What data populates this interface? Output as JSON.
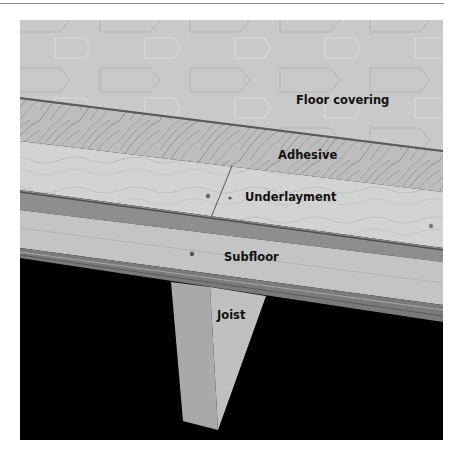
{
  "figure": {
    "labels": {
      "floor_covering": "Floor covering",
      "adhesive": "Adhesive",
      "underlayment": "Underlayment",
      "subfloor": "Subfloor",
      "joist": "Joist"
    },
    "layers_top_to_bottom": [
      "Floor covering",
      "Adhesive",
      "Underlayment",
      "Subfloor",
      "Joist"
    ],
    "colors": {
      "floor_covering": "#c9c9c9",
      "adhesive": "#b9b9b9",
      "underlayment": "#d2d2d2",
      "subfloor_edge": "#8c8c8c",
      "subfloor": "#c2c2c2",
      "joist": "#b5b5b5",
      "background": "#000000"
    }
  }
}
